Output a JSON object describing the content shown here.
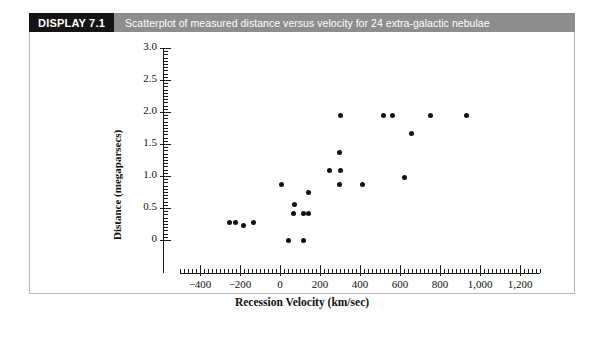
{
  "header": {
    "display_tag": "DISPLAY 7.1",
    "caption": "Scatterplot of measured distance versus velocity for 24 extra-galactic nebulae"
  },
  "chart_data": {
    "type": "scatter",
    "title": "Scatterplot of measured distance versus velocity for 24 extra-galactic nebulae",
    "xlabel": "Recession Velocity (km/sec)",
    "ylabel": "Distance (megaparsecs)",
    "xlim": [
      -500,
      1300
    ],
    "ylim": [
      0,
      3.0
    ],
    "xticks": [
      -400,
      -200,
      0,
      200,
      400,
      600,
      800,
      1000,
      1200
    ],
    "xtick_labels": [
      "−400",
      "−200",
      "0",
      "200",
      "400",
      "600",
      "800",
      "1,000",
      "1,200"
    ],
    "yticks": [
      0,
      0.5,
      1.0,
      1.5,
      2.0,
      2.5,
      3.0
    ],
    "ytick_labels": [
      "0",
      "0.5",
      "1.0",
      "1.5",
      "2.0",
      "2.5",
      "3.0"
    ],
    "x_minor_tick_step": 20,
    "y_minor_tick_step": 0.05,
    "grid": false,
    "legend": null,
    "n_points": 24,
    "points": [
      {
        "x": -255,
        "y": 0.27
      },
      {
        "x": -225,
        "y": 0.27
      },
      {
        "x": -185,
        "y": 0.22
      },
      {
        "x": -135,
        "y": 0.27
      },
      {
        "x": 5,
        "y": 0.86
      },
      {
        "x": 40,
        "y": 0.0
      },
      {
        "x": 65,
        "y": 0.41
      },
      {
        "x": 70,
        "y": 0.55
      },
      {
        "x": 115,
        "y": 0.0
      },
      {
        "x": 115,
        "y": 0.42
      },
      {
        "x": 140,
        "y": 0.42
      },
      {
        "x": 140,
        "y": 0.75
      },
      {
        "x": 245,
        "y": 1.08
      },
      {
        "x": 295,
        "y": 0.86
      },
      {
        "x": 295,
        "y": 1.36
      },
      {
        "x": 300,
        "y": 1.08
      },
      {
        "x": 300,
        "y": 1.94
      },
      {
        "x": 410,
        "y": 0.86
      },
      {
        "x": 515,
        "y": 1.94
      },
      {
        "x": 560,
        "y": 1.94
      },
      {
        "x": 620,
        "y": 0.98
      },
      {
        "x": 655,
        "y": 1.67
      },
      {
        "x": 750,
        "y": 1.94
      },
      {
        "x": 930,
        "y": 1.94
      }
    ]
  },
  "colors": {
    "tag_background": "#141414",
    "caption_background": "#8e8e8e",
    "point": "#121212",
    "axis": "#1a1a1a",
    "frame_border": "#b9b9b9"
  }
}
